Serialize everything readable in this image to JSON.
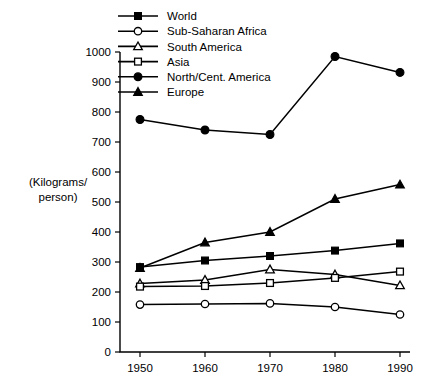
{
  "chart_data": {
    "type": "line",
    "title": "",
    "xlabel": "",
    "ylabel": "(Kilograms/\nperson)",
    "ylabel_line1": "(Kilograms/",
    "ylabel_line2": "person)",
    "x": [
      1950,
      1960,
      1970,
      1980,
      1990
    ],
    "xtick_labels": [
      "1950",
      "1960",
      "1970",
      "1980",
      "1990"
    ],
    "ytick_labels": [
      "0",
      "100",
      "200",
      "300",
      "400",
      "500",
      "600",
      "700",
      "800",
      "900",
      "1000"
    ],
    "yticks": [
      0,
      100,
      200,
      300,
      400,
      500,
      600,
      700,
      800,
      900,
      1000
    ],
    "ylim": [
      0,
      1000
    ],
    "xlim": [
      1945,
      1995
    ],
    "grid": false,
    "legend_position": "top-left",
    "series": [
      {
        "name": "World",
        "marker": "filled-square",
        "values": [
          283,
          305,
          320,
          338,
          362
        ]
      },
      {
        "name": "Sub-Saharan Africa",
        "marker": "open-circle",
        "values": [
          158,
          160,
          162,
          150,
          125
        ]
      },
      {
        "name": "South America",
        "marker": "open-triangle",
        "values": [
          228,
          240,
          275,
          258,
          222
        ]
      },
      {
        "name": "Asia",
        "marker": "open-square",
        "values": [
          218,
          220,
          230,
          247,
          268
        ]
      },
      {
        "name": "North/Cent. America",
        "marker": "filled-circle",
        "values": [
          775,
          740,
          725,
          985,
          932
        ]
      },
      {
        "name": "Europe",
        "marker": "filled-triangle",
        "values": [
          280,
          365,
          400,
          510,
          558
        ]
      }
    ]
  },
  "legend": {
    "items": [
      {
        "label": "World"
      },
      {
        "label": "Sub-Saharan Africa"
      },
      {
        "label": "South America"
      },
      {
        "label": "Asia"
      },
      {
        "label": "North/Cent. America"
      },
      {
        "label": "Europe"
      }
    ]
  },
  "colors": {
    "ink": "#000000",
    "background": "#ffffff"
  }
}
